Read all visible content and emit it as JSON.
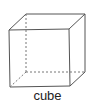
{
  "diagram": {
    "title": "cube",
    "label": "cube",
    "colors": {
      "line": "#555555",
      "hidden_line": "#777777",
      "background": "#ffffff"
    },
    "vertices": {
      "front_top_left": [
        9,
        30
      ],
      "front_top_right": [
        69,
        29
      ],
      "front_bottom_left": [
        10,
        87
      ],
      "front_bottom_right": [
        70,
        86
      ],
      "back_top_left": [
        26,
        14
      ],
      "back_top_right": [
        85,
        14
      ],
      "back_bottom_left": [
        26,
        72
      ],
      "back_bottom_right": [
        85,
        72
      ]
    }
  }
}
